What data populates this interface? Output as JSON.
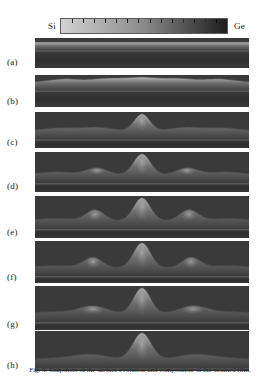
{
  "figure": {
    "kind": "simulation-series",
    "caption": "Fig. 5. Snapshots of the surface evolution and composition of the strained film."
  },
  "colorbar": {
    "left_label": "Si",
    "right_label": "Ge",
    "left_color": "#d2d2d2",
    "mid_color": "#8a8a8a",
    "right_color": "#1d1d1d",
    "tick_count": 15,
    "orientation": "horizontal",
    "border_color": "#5a5a5a"
  },
  "palette": {
    "background": "#ffffff",
    "substrate": "#3a3a3a",
    "substrate_dark": "#2e2e2e",
    "film_base": "#6f6f6f",
    "film_light": "#b9b9b9",
    "peak_core": "#a8a8a8",
    "interface_line": "#8f8f8f",
    "outline": "#4a4a4a",
    "text": "#1a1a1a"
  },
  "panels": [
    {
      "id": "a",
      "label": "(a)",
      "description": "flat uniform film, no surface undulation",
      "top": 38,
      "height": 30,
      "film_thickness": 9,
      "peaks": []
    },
    {
      "id": "b",
      "label": "(b)",
      "description": "small amplitude periodic ripples forming",
      "top": 75,
      "height": 32,
      "film_thickness": 9,
      "peaks": [
        {
          "x": 30,
          "amp": 3.2,
          "width": 22
        },
        {
          "x": 72,
          "amp": 3.6,
          "width": 22
        },
        {
          "x": 107,
          "amp": 4.6,
          "width": 22
        },
        {
          "x": 143,
          "amp": 3.6,
          "width": 22
        },
        {
          "x": 184,
          "amp": 3.2,
          "width": 22
        }
      ]
    },
    {
      "id": "c",
      "label": "(c)",
      "description": "one central island nucleates above the rippled film",
      "top": 112,
      "height": 36,
      "film_thickness": 9,
      "peaks": [
        {
          "x": 24,
          "amp": 3.0,
          "width": 24
        },
        {
          "x": 62,
          "amp": 3.6,
          "width": 22
        },
        {
          "x": 107,
          "amp": 17.0,
          "width": 11
        },
        {
          "x": 150,
          "amp": 3.6,
          "width": 22
        },
        {
          "x": 188,
          "amp": 3.0,
          "width": 24
        }
      ]
    },
    {
      "id": "d",
      "label": "(d)",
      "description": "central island grows, two side islands emerge",
      "top": 152,
      "height": 40,
      "film_thickness": 9,
      "peaks": [
        {
          "x": 22,
          "amp": 3.0,
          "width": 24
        },
        {
          "x": 62,
          "amp": 7.0,
          "width": 15
        },
        {
          "x": 107,
          "amp": 21.0,
          "width": 12
        },
        {
          "x": 152,
          "amp": 7.0,
          "width": 15
        },
        {
          "x": 190,
          "amp": 3.0,
          "width": 24
        }
      ]
    },
    {
      "id": "e",
      "label": "(e)",
      "description": "three well separated islands, central one largest",
      "top": 196,
      "height": 42,
      "film_thickness": 9,
      "peaks": [
        {
          "x": 20,
          "amp": 2.4,
          "width": 26
        },
        {
          "x": 60,
          "amp": 11.0,
          "width": 13
        },
        {
          "x": 107,
          "amp": 23.0,
          "width": 12
        },
        {
          "x": 154,
          "amp": 11.0,
          "width": 13
        },
        {
          "x": 193,
          "amp": 2.4,
          "width": 26
        }
      ]
    },
    {
      "id": "f",
      "label": "(f)",
      "description": "central island continues to grow at expense of neighbours",
      "top": 241,
      "height": 42,
      "film_thickness": 9,
      "peaks": [
        {
          "x": 20,
          "amp": 2.2,
          "width": 26
        },
        {
          "x": 58,
          "amp": 10.5,
          "width": 13
        },
        {
          "x": 107,
          "amp": 25.0,
          "width": 12
        },
        {
          "x": 156,
          "amp": 10.5,
          "width": 13
        },
        {
          "x": 194,
          "amp": 2.2,
          "width": 26
        }
      ]
    },
    {
      "id": "g",
      "label": "(g)",
      "description": "side islands flatten into broad shoulders, central island dominant",
      "top": 286,
      "height": 44,
      "film_thickness": 9,
      "peaks": [
        {
          "x": 18,
          "amp": 2.0,
          "width": 28
        },
        {
          "x": 58,
          "amp": 8.0,
          "width": 20
        },
        {
          "x": 107,
          "amp": 26.0,
          "width": 12
        },
        {
          "x": 158,
          "amp": 8.0,
          "width": 20
        },
        {
          "x": 196,
          "amp": 2.0,
          "width": 28
        }
      ]
    },
    {
      "id": "h",
      "label": "(h)",
      "description": "single dominant island with broad smooth shoulders, coarsening complete",
      "top": 331,
      "height": 40,
      "film_thickness": 9,
      "peaks": [
        {
          "x": 16,
          "amp": 1.6,
          "width": 30
        },
        {
          "x": 56,
          "amp": 5.5,
          "width": 26
        },
        {
          "x": 107,
          "amp": 27.0,
          "width": 13
        },
        {
          "x": 160,
          "amp": 5.5,
          "width": 26
        },
        {
          "x": 198,
          "amp": 1.6,
          "width": 30
        }
      ]
    }
  ]
}
